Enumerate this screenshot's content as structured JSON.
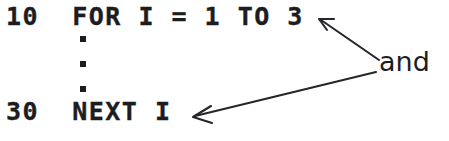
{
  "figure": {
    "background_color": "#ffffff",
    "ink_color": "#1d1d1f",
    "arrow_color": "#25252a",
    "width": 449,
    "height": 141
  },
  "code": {
    "line_for": "10  FOR I = 1 TO 3",
    "line_next": "30  NEXT I",
    "ellipsis_dots": 3
  },
  "annotation": {
    "label": "and",
    "arrows": [
      {
        "name": "arrow-to-loop-limit",
        "points_to": "3",
        "from_x": 379,
        "from_y": 60,
        "to_x": 319,
        "to_y": 19
      },
      {
        "name": "arrow-to-next-variable",
        "points_to": "I",
        "from_x": 376,
        "from_y": 72,
        "to_x": 193,
        "to_y": 117
      }
    ]
  }
}
